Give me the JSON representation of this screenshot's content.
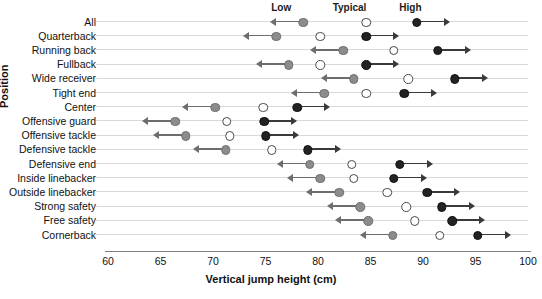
{
  "chart_data": {
    "type": "scatter",
    "title": "",
    "xlabel": "Vertical jump height (cm)",
    "ylabel": "Position",
    "xlim": [
      60,
      100
    ],
    "xticks": [
      60,
      65,
      70,
      75,
      80,
      85,
      90,
      95,
      100
    ],
    "grid": true,
    "legend_position": "top",
    "column_headers": [
      "Low",
      "Typical",
      "High"
    ],
    "series": [
      {
        "name": "Low",
        "marker": "filled-gray-circle",
        "color": "#8c8c8c"
      },
      {
        "name": "Typical",
        "marker": "open-circle",
        "color": "#ffffff"
      },
      {
        "name": "High",
        "marker": "filled-black-circle",
        "color": "#232323"
      }
    ],
    "categories": [
      "All",
      "Quarterback",
      "Running back",
      "Fullback",
      "Wide receiver",
      "Tight end",
      "Center",
      "Offensive guard",
      "Offensive tackle",
      "Defensive tackle",
      "Defensive end",
      "Inside linebacker",
      "Outside linebacker",
      "Strong safety",
      "Free safety",
      "Cornerback"
    ],
    "rows": [
      {
        "position": "All",
        "low": 78.6,
        "typical": 84.6,
        "high": 89.4
      },
      {
        "position": "Quarterback",
        "low": 76.0,
        "typical": 80.2,
        "high": 84.6
      },
      {
        "position": "Running back",
        "low": 82.4,
        "typical": 87.2,
        "high": 91.4
      },
      {
        "position": "Fullback",
        "low": 77.2,
        "typical": 80.2,
        "high": 84.6
      },
      {
        "position": "Wide receiver",
        "low": 83.4,
        "typical": 88.6,
        "high": 93.0
      },
      {
        "position": "Tight end",
        "low": 80.6,
        "typical": 84.6,
        "high": 88.2
      },
      {
        "position": "Center",
        "low": 70.2,
        "typical": 74.8,
        "high": 78.0
      },
      {
        "position": "Offensive guard",
        "low": 66.4,
        "typical": 71.3,
        "high": 74.9
      },
      {
        "position": "Offensive tackle",
        "low": 67.4,
        "typical": 71.6,
        "high": 75.0
      },
      {
        "position": "Defensive tackle",
        "low": 71.2,
        "typical": 75.6,
        "high": 79.0
      },
      {
        "position": "Defensive end",
        "low": 79.2,
        "typical": 83.2,
        "high": 87.8
      },
      {
        "position": "Inside linebacker",
        "low": 80.2,
        "typical": 83.4,
        "high": 87.2
      },
      {
        "position": "Outside linebacker",
        "low": 82.0,
        "typical": 86.6,
        "high": 90.4
      },
      {
        "position": "Strong safety",
        "low": 84.0,
        "typical": 88.4,
        "high": 91.8
      },
      {
        "position": "Free safety",
        "low": 84.8,
        "typical": 89.2,
        "high": 92.8
      },
      {
        "position": "Cornerback",
        "low": 87.1,
        "typical": 91.6,
        "high": 95.2
      }
    ]
  },
  "headers": {
    "low": "Low",
    "typical": "Typical",
    "high": "High"
  },
  "axes": {
    "x_title": "Vertical jump height (cm)",
    "y_title": "Position",
    "x_tick_labels": [
      "60",
      "65",
      "70",
      "75",
      "80",
      "85",
      "90",
      "95",
      "100"
    ]
  }
}
